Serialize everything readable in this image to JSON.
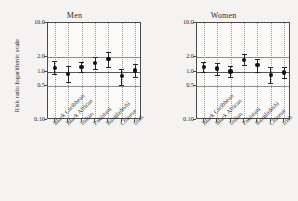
{
  "figure": {
    "ylabel": "Risk ratio logarithmic scale",
    "background": "#f4f3f1",
    "panel_background": "#fbfaf8",
    "marker_color": "#111111",
    "reference_line_color": "#8d8d8d"
  },
  "chart_data": {
    "type": "scatter",
    "title": "",
    "xlabel": "",
    "ylabel": "Risk ratio logarithmic scale",
    "scale": "log",
    "ylim": [
      0.1,
      10.0
    ],
    "yticks": [
      "10.0",
      "2.0",
      "1.0",
      "0.5",
      "0.10"
    ],
    "ytick_values": [
      10.0,
      2.0,
      1.0,
      0.5,
      0.1
    ],
    "grid": "vertical dotted per category, horizontal reference lines at 2.0, 1.0, 0.5",
    "reference_lines": [
      2.0,
      1.0,
      0.5
    ],
    "legend": "none",
    "categories": [
      "Black Caribbean",
      "Black African",
      "Indian",
      "Pakistani",
      "Bangladeshi",
      "Chinese",
      "Irish"
    ],
    "panels": [
      {
        "label": "Men",
        "values": [
          1.2,
          0.9,
          1.25,
          1.5,
          1.8,
          0.8,
          1.05
        ],
        "ci_low": [
          0.88,
          0.62,
          0.97,
          1.1,
          1.22,
          0.52,
          0.76
        ],
        "ci_high": [
          1.62,
          1.28,
          1.6,
          2.0,
          2.55,
          1.15,
          1.45
        ]
      },
      {
        "label": "Women",
        "values": [
          1.25,
          1.15,
          1.0,
          1.75,
          1.35,
          0.85,
          0.95
        ],
        "ci_low": [
          0.98,
          0.85,
          0.76,
          1.33,
          0.98,
          0.58,
          0.72
        ],
        "ci_high": [
          1.6,
          1.52,
          1.3,
          2.25,
          1.85,
          1.22,
          1.25
        ]
      }
    ]
  }
}
